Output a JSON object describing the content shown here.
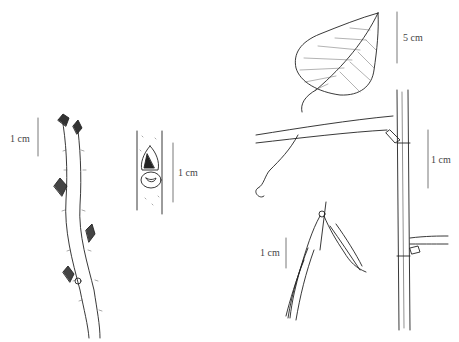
{
  "plate": {
    "subject": "botanical illustration: twig, bud, leaf, tendril node and fruits",
    "colors": {
      "ink": "#222222",
      "background": "#ffffff",
      "scale_bar": "#555555"
    }
  },
  "figures": [
    {
      "id": "twig",
      "scale_label": "1 cm"
    },
    {
      "id": "bud-detail",
      "scale_label": "1 cm"
    },
    {
      "id": "leaf",
      "scale_label": "5 cm"
    },
    {
      "id": "stem-node-with-tendril",
      "scale_label": "1 cm"
    },
    {
      "id": "fruit-cluster",
      "scale_label": "1 cm"
    }
  ]
}
